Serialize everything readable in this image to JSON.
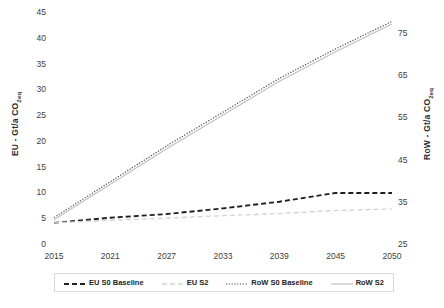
{
  "chart_data": {
    "type": "line",
    "title": "",
    "xlabel": "",
    "x": [
      2015,
      2021,
      2027,
      2033,
      2039,
      2045,
      2050
    ],
    "tick_labels_x": [
      "2015",
      "2021",
      "2027",
      "2033",
      "2039",
      "2045",
      "2050"
    ],
    "axes": {
      "left": {
        "label": "EU - Gt/a CO",
        "label_sub": "2eq",
        "ticks": [
          "45",
          "40",
          "35",
          "30",
          "25",
          "20",
          "15",
          "10",
          "5",
          "0"
        ],
        "tick_values": [
          45,
          40,
          35,
          30,
          25,
          20,
          15,
          10,
          5,
          0
        ],
        "ylim": [
          0,
          45
        ],
        "grid": false
      },
      "right": {
        "label": "RoW - Gt/a CO",
        "label_sub": "2eq",
        "ticks": [
          "75",
          "65",
          "55",
          "45",
          "35",
          "25"
        ],
        "tick_values": [
          75,
          65,
          55,
          45,
          35,
          25
        ],
        "ylim": [
          25,
          80
        ],
        "grid": false
      }
    },
    "legend_position": "bottom",
    "series": [
      {
        "name": "EU S0 Baseline",
        "axis": "left",
        "style": "dashed-bold",
        "color": "#222222",
        "values": [
          4.3,
          5.3,
          6.0,
          7.1,
          8.4,
          10.1,
          10.1
        ]
      },
      {
        "name": "EU S2",
        "axis": "left",
        "style": "dashed-light",
        "color": "#c9c9c9",
        "values": [
          4.3,
          4.8,
          5.2,
          5.7,
          6.1,
          6.7,
          7.0
        ]
      },
      {
        "name": "RoW S0 Baseline",
        "axis": "right",
        "style": "dotted",
        "color": "#555555",
        "values": [
          31.5,
          40.0,
          48.5,
          56.5,
          64.5,
          71.5,
          78.0
        ]
      },
      {
        "name": "RoW S2",
        "axis": "right",
        "style": "solid-light",
        "color": "#b8b8b8",
        "values": [
          31.0,
          39.4,
          47.8,
          55.8,
          63.8,
          70.8,
          77.4
        ]
      }
    ]
  },
  "legend": {
    "items": [
      {
        "label": "EU S0 Baseline",
        "swatch": "dashed-bold"
      },
      {
        "label": "EU S2",
        "swatch": "dashed-light"
      },
      {
        "label": "RoW S0 Baseline",
        "swatch": "dotted"
      },
      {
        "label": "RoW S2",
        "swatch": "solid-light"
      }
    ]
  },
  "plot_geometry": {
    "left": 54,
    "right": 392,
    "top": 13,
    "bottom": 245
  }
}
